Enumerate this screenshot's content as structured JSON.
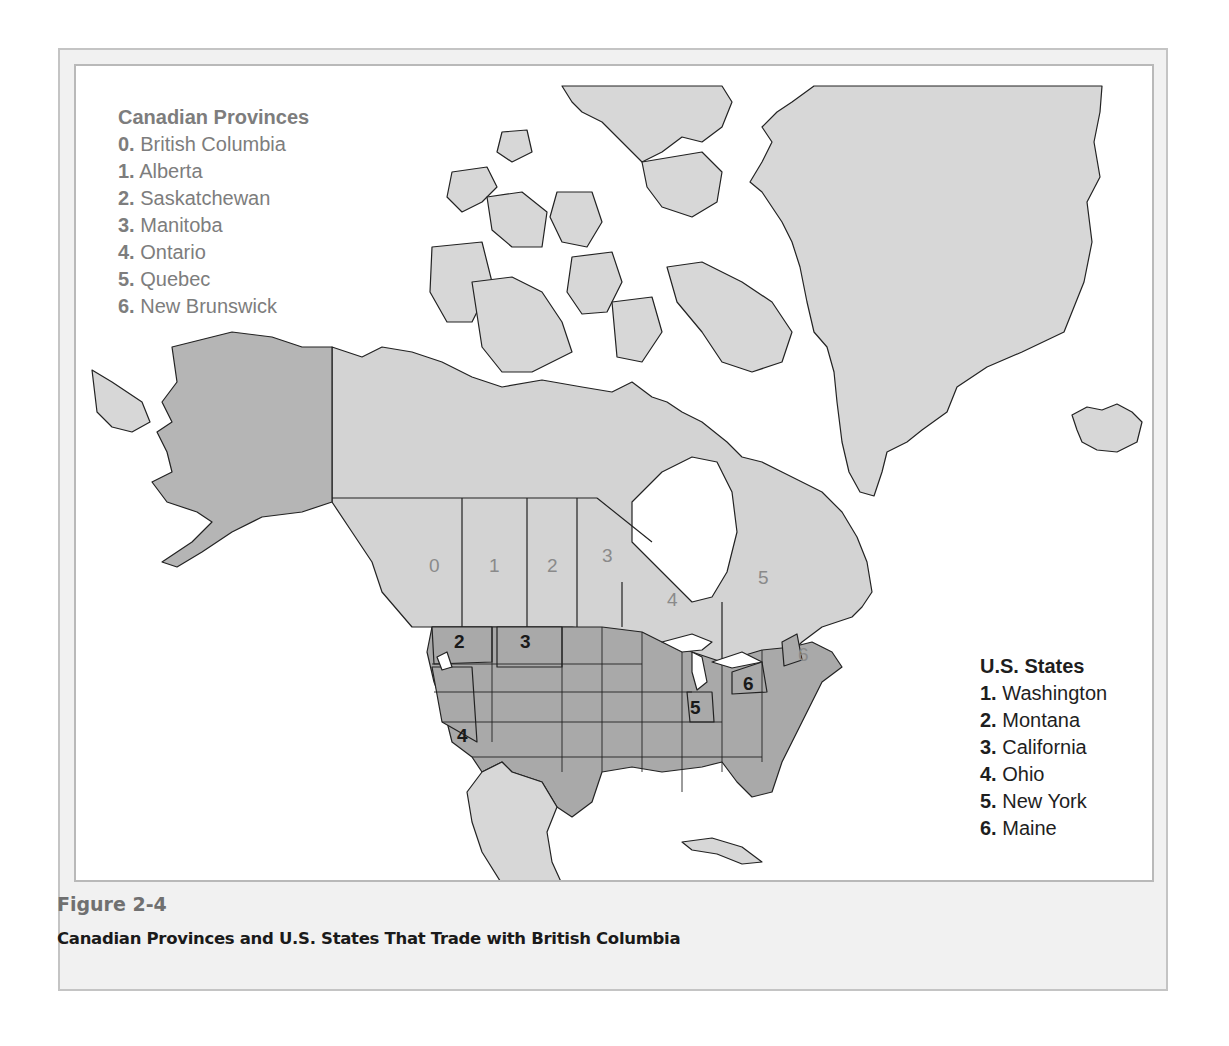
{
  "figure": {
    "number": "Figure 2-4",
    "title": "Canadian Provinces and U.S. States That Trade with British Columbia"
  },
  "legend_canada": {
    "title": "Canadian Provinces",
    "items": [
      {
        "num": "0.",
        "name": "British Columbia"
      },
      {
        "num": "1.",
        "name": "Alberta"
      },
      {
        "num": "2.",
        "name": "Saskatchewan"
      },
      {
        "num": "3.",
        "name": "Manitoba"
      },
      {
        "num": "4.",
        "name": "Ontario"
      },
      {
        "num": "5.",
        "name": "Quebec"
      },
      {
        "num": "6.",
        "name": "New Brunswick"
      }
    ]
  },
  "legend_us": {
    "title": "U.S. States",
    "items": [
      {
        "num": "1.",
        "name": "Washington"
      },
      {
        "num": "2.",
        "name": "Montana"
      },
      {
        "num": "3.",
        "name": "California"
      },
      {
        "num": "4.",
        "name": "Ohio"
      },
      {
        "num": "5.",
        "name": "New York"
      },
      {
        "num": "6.",
        "name": "Maine"
      }
    ]
  },
  "map_labels": {
    "canada": [
      "0",
      "1",
      "2",
      "3",
      "4",
      "5",
      "6"
    ],
    "us": [
      "1",
      "2",
      "3",
      "4",
      "5",
      "6"
    ]
  },
  "colors": {
    "canada_fill": "#d3d3d3",
    "us_fill": "#a9a9a9",
    "alaska_fill": "#b5b5b5",
    "other_land_fill": "#d7d7d7",
    "water": "#ffffff",
    "border": "#222222",
    "canada_label": "#8a8a8a",
    "us_label": "#1a1a1a"
  }
}
